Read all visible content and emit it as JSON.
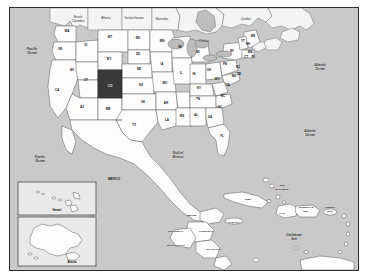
{
  "map": {
    "title": "North America Political Map",
    "highlight": {
      "state_code": "CO",
      "state_name": "Colorado",
      "fill": "#3a3a3a"
    },
    "background_water": "#c9c9c9",
    "land_fill": "#fdfdfd",
    "border_color": "#2b2b2b",
    "oceans": [
      {
        "name": "Pacific\nOcean",
        "line1": "Pacific",
        "line2": "Ocean"
      },
      {
        "name": "Atlantic\nOcean",
        "line1": "Atlantic",
        "line2": "Ocean"
      },
      {
        "name": "Gulf of\nMexico",
        "line1": "Gulf of",
        "line2": "Mexico"
      },
      {
        "name": "Caribbean\nSea",
        "line1": "Caribbean",
        "line2": "Sea"
      }
    ],
    "states": [
      {
        "code": "WA",
        "x": 57,
        "y": 24
      },
      {
        "code": "OR",
        "x": 50,
        "y": 42
      },
      {
        "code": "CA",
        "x": 47,
        "y": 83
      },
      {
        "code": "NV",
        "x": 62,
        "y": 63
      },
      {
        "code": "ID",
        "x": 76,
        "y": 38
      },
      {
        "code": "UT",
        "x": 76,
        "y": 73
      },
      {
        "code": "AZ",
        "x": 72,
        "y": 100
      },
      {
        "code": "MT",
        "x": 100,
        "y": 30
      },
      {
        "code": "WY",
        "x": 99,
        "y": 52
      },
      {
        "code": "CO",
        "x": 101,
        "y": 78
      },
      {
        "code": "NM",
        "x": 98,
        "y": 102
      },
      {
        "code": "ND",
        "x": 128,
        "y": 31
      },
      {
        "code": "SD",
        "x": 128,
        "y": 47
      },
      {
        "code": "NE",
        "x": 129,
        "y": 62
      },
      {
        "code": "KS",
        "x": 131,
        "y": 78
      },
      {
        "code": "OK",
        "x": 133,
        "y": 95
      },
      {
        "code": "TX",
        "x": 124,
        "y": 118
      },
      {
        "code": "MN",
        "x": 152,
        "y": 34
      },
      {
        "code": "IA",
        "x": 152,
        "y": 57
      },
      {
        "code": "MO",
        "x": 155,
        "y": 76
      },
      {
        "code": "AR",
        "x": 156,
        "y": 96
      },
      {
        "code": "LA",
        "x": 157,
        "y": 113
      },
      {
        "code": "WI",
        "x": 170,
        "y": 40
      },
      {
        "code": "IL",
        "x": 171,
        "y": 66
      },
      {
        "code": "MS",
        "x": 172,
        "y": 109
      },
      {
        "code": "MI",
        "x": 188,
        "y": 45
      },
      {
        "code": "IN",
        "x": 184,
        "y": 67
      },
      {
        "code": "KY",
        "x": 189,
        "y": 81
      },
      {
        "code": "TN",
        "x": 188,
        "y": 92
      },
      {
        "code": "AL",
        "x": 186,
        "y": 108
      },
      {
        "code": "OH",
        "x": 199,
        "y": 63
      },
      {
        "code": "GA",
        "x": 200,
        "y": 110
      },
      {
        "code": "FL",
        "x": 212,
        "y": 129
      },
      {
        "code": "SC",
        "x": 210,
        "y": 100
      },
      {
        "code": "NC",
        "x": 213,
        "y": 89
      },
      {
        "code": "WV",
        "x": 207,
        "y": 72
      },
      {
        "code": "VA",
        "x": 218,
        "y": 78
      },
      {
        "code": "PA",
        "x": 215,
        "y": 57
      },
      {
        "code": "NY",
        "x": 222,
        "y": 44
      },
      {
        "code": "ME",
        "x": 243,
        "y": 29
      },
      {
        "code": "VT",
        "x": 233,
        "y": 34
      },
      {
        "code": "NH",
        "x": 238,
        "y": 37
      },
      {
        "code": "MA",
        "x": 240,
        "y": 45
      },
      {
        "code": "CT",
        "x": 236,
        "y": 50
      },
      {
        "code": "RI",
        "x": 243,
        "y": 50
      },
      {
        "code": "NJ",
        "x": 228,
        "y": 60
      },
      {
        "code": "DE",
        "x": 229,
        "y": 67
      },
      {
        "code": "MD",
        "x": 224,
        "y": 69
      }
    ],
    "provinces": [
      {
        "name": "British\nColumbia",
        "line1": "British",
        "line2": "Columbia",
        "x": 68,
        "y": 11
      },
      {
        "name": "Alberta",
        "line1": "Alberta",
        "line2": "",
        "x": 96,
        "y": 10
      },
      {
        "name": "Saskatchewan",
        "line1": "Saskatchewan",
        "line2": "",
        "x": 124,
        "y": 10
      },
      {
        "name": "Manitoba",
        "line1": "Manitoba",
        "line2": "",
        "x": 152,
        "y": 11
      },
      {
        "name": "Ontario",
        "line1": "Ontario",
        "line2": "",
        "x": 192,
        "y": 16
      },
      {
        "name": "Quebec",
        "line1": "Quebec",
        "line2": "",
        "x": 228,
        "y": 10
      }
    ],
    "countries": [
      {
        "name": "MEXICO",
        "x": 110,
        "y": 173
      },
      {
        "name": "BELIZE",
        "x": 186,
        "y": 212
      },
      {
        "name": "GUATEMALA",
        "x": 170,
        "y": 226
      },
      {
        "name": "HONDURAS",
        "x": 196,
        "y": 224
      },
      {
        "name": "EL SALVADOR",
        "x": 172,
        "y": 238
      },
      {
        "name": "NICARAGUA",
        "x": 203,
        "y": 240
      }
    ],
    "islands": [
      {
        "name": "CUBA",
        "x": 234,
        "y": 192
      },
      {
        "name": "JAMAICA",
        "x": 222,
        "y": 215
      },
      {
        "name": "HAITI",
        "x": 271,
        "y": 205
      },
      {
        "name": "DOMINICAN\nREP.",
        "line1": "DOMINICAN",
        "line2": "REP.",
        "x": 289,
        "y": 202
      },
      {
        "name": "PUERTO\nRICO",
        "line1": "PUERTO",
        "line2": "RICO",
        "x": 318,
        "y": 203
      },
      {
        "name": "THE\nBAHAMAS",
        "line1": "THE",
        "line2": "BAHAMAS",
        "x": 270,
        "y": 182
      }
    ],
    "insets": [
      {
        "id": "hawaii",
        "label": "Hawaii"
      },
      {
        "id": "alaska",
        "label": "Alaska"
      }
    ]
  }
}
